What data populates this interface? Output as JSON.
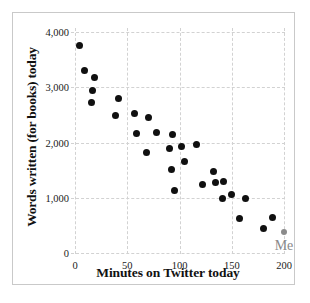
{
  "chart_data": {
    "type": "scatter",
    "title": "",
    "xlabel": "Minutes on Twitter today",
    "ylabel": "Words written (for books) today",
    "xlim": [
      0,
      200
    ],
    "ylim": [
      0,
      4000
    ],
    "xticks": [
      "0",
      "50",
      "100",
      "150",
      "200"
    ],
    "xtick_values": [
      0,
      50,
      100,
      150,
      200
    ],
    "yticks": [
      "0",
      "1,000",
      "2,000",
      "3,000",
      "4,000"
    ],
    "ytick_values": [
      0,
      1000,
      2000,
      3000,
      4000
    ],
    "grid": true,
    "legend": "none",
    "series": [
      {
        "name": "others",
        "color": "#101010",
        "points": [
          [
            4,
            3760
          ],
          [
            9,
            3310
          ],
          [
            19,
            3180
          ],
          [
            17,
            2940
          ],
          [
            16,
            2720
          ],
          [
            42,
            2800
          ],
          [
            39,
            2490
          ],
          [
            57,
            2530
          ],
          [
            59,
            2160
          ],
          [
            70,
            2450
          ],
          [
            68,
            1810
          ],
          [
            78,
            2180
          ],
          [
            90,
            1900
          ],
          [
            93,
            2150
          ],
          [
            92,
            1520
          ],
          [
            95,
            1140
          ],
          [
            102,
            1930
          ],
          [
            105,
            1650
          ],
          [
            116,
            1960
          ],
          [
            122,
            1240
          ],
          [
            133,
            1470
          ],
          [
            134,
            1270
          ],
          [
            142,
            1290
          ],
          [
            141,
            990
          ],
          [
            150,
            1050
          ],
          [
            163,
            980
          ],
          [
            157,
            620
          ],
          [
            180,
            450
          ],
          [
            189,
            640
          ]
        ]
      },
      {
        "name": "me",
        "color": "#8b8b8b",
        "points": [
          [
            200,
            380
          ]
        ],
        "annotation": "Me"
      }
    ],
    "annotations": [
      {
        "text": "Me",
        "x": 200,
        "y": 380,
        "color": "#8a8a8a"
      }
    ]
  }
}
